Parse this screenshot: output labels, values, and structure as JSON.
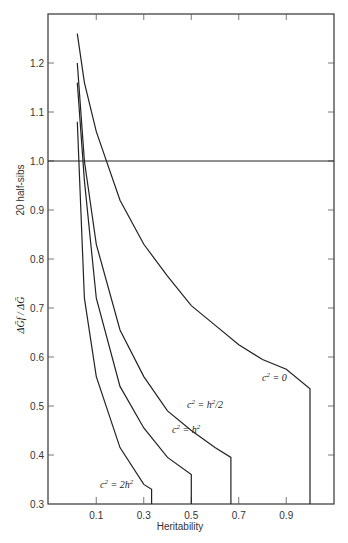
{
  "chart_data": {
    "type": "line",
    "title": "",
    "xlabel": "Heritability",
    "ylabel": "ΔḠf / ΔḠ",
    "ylabel_secondary": "20 half-sibs",
    "xlim": [
      0.0,
      1.1
    ],
    "ylim": [
      0.3,
      1.3
    ],
    "x_ticks": [
      0.1,
      0.3,
      0.5,
      0.7,
      0.9
    ],
    "x_tick_labels": [
      "0.1",
      "0.3",
      "0.5",
      "0.7",
      "0.9"
    ],
    "y_ticks": [
      0.3,
      0.4,
      0.5,
      0.6,
      0.7,
      0.8,
      0.9,
      1.0,
      1.1,
      1.2
    ],
    "y_tick_labels": [
      "0.3",
      "0.4",
      "0.5",
      "0.6",
      "0.7",
      "0.8",
      "0.9",
      "1.0",
      "1.1",
      "1.2"
    ],
    "reference_line": {
      "y": 1.0
    },
    "grid": false,
    "legend": "inline labels",
    "series": [
      {
        "name": "c² = 0",
        "label_parts": [
          "c",
          "2",
          " = 0"
        ],
        "x": [
          0.02,
          0.05,
          0.1,
          0.2,
          0.3,
          0.4,
          0.5,
          0.6,
          0.7,
          0.8,
          0.9,
          1.0,
          1.0
        ],
        "y": [
          1.26,
          1.16,
          1.06,
          0.92,
          0.83,
          0.765,
          0.705,
          0.665,
          0.625,
          0.595,
          0.575,
          0.535,
          0.3
        ]
      },
      {
        "name": "c² = h²/2",
        "label_parts": [
          "c",
          "2",
          " = h",
          "2",
          "/2"
        ],
        "x": [
          0.02,
          0.05,
          0.1,
          0.2,
          0.3,
          0.4,
          0.5,
          0.6,
          0.667,
          0.667
        ],
        "y": [
          1.2,
          1.0,
          0.83,
          0.655,
          0.56,
          0.49,
          0.45,
          0.415,
          0.395,
          0.3
        ]
      },
      {
        "name": "c² = h²",
        "label_parts": [
          "c",
          "2",
          " = h",
          "2"
        ],
        "x": [
          0.02,
          0.05,
          0.1,
          0.2,
          0.3,
          0.4,
          0.5,
          0.5
        ],
        "y": [
          1.16,
          0.96,
          0.72,
          0.54,
          0.455,
          0.395,
          0.36,
          0.3
        ]
      },
      {
        "name": "c² = 2h²",
        "label_parts": [
          "c",
          "2",
          " = 2h",
          "2"
        ],
        "x": [
          0.02,
          0.05,
          0.1,
          0.2,
          0.3,
          0.333,
          0.333
        ],
        "y": [
          1.08,
          0.72,
          0.56,
          0.415,
          0.34,
          0.33,
          0.3
        ]
      }
    ]
  }
}
